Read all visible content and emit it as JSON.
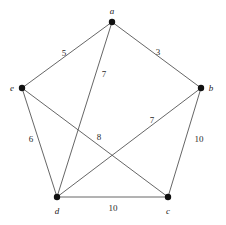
{
  "figure": {
    "type": "weighted-graph-diagram",
    "background_color": "#ffffff",
    "edge_color": "#555555",
    "node_color": "#111111",
    "label_color": "#1a1a1a"
  },
  "chart_data": {
    "type": "diagram",
    "title": "",
    "xlabel": "",
    "ylabel": "",
    "nodes": [
      {
        "id": "a",
        "label": "a",
        "x": 112,
        "y": 22,
        "label_x": 112,
        "label_y": 11
      },
      {
        "id": "b",
        "label": "b",
        "x": 201,
        "y": 88,
        "label_x": 211,
        "label_y": 88
      },
      {
        "id": "c",
        "label": "c",
        "x": 168,
        "y": 197,
        "label_x": 168,
        "label_y": 211
      },
      {
        "id": "d",
        "label": "d",
        "x": 57,
        "y": 197,
        "label_x": 57,
        "label_y": 211
      },
      {
        "id": "e",
        "label": "e",
        "x": 22,
        "y": 88,
        "label_x": 12,
        "label_y": 88
      }
    ],
    "edges": [
      {
        "from": "a",
        "to": "e",
        "weight": "5",
        "label_x": 64,
        "label_y": 53
      },
      {
        "from": "a",
        "to": "b",
        "weight": "3",
        "label_x": 158,
        "label_y": 52
      },
      {
        "from": "a",
        "to": "d",
        "weight": "7",
        "label_x": 104,
        "label_y": 74
      },
      {
        "from": "e",
        "to": "d",
        "weight": "6",
        "label_x": 31,
        "label_y": 139
      },
      {
        "from": "e",
        "to": "c",
        "weight": "8",
        "label_x": 99,
        "label_y": 137
      },
      {
        "from": "d",
        "to": "b",
        "weight": "7",
        "label_x": 152,
        "label_y": 120
      },
      {
        "from": "b",
        "to": "c",
        "weight": "10",
        "label_x": 199,
        "label_y": 139
      },
      {
        "from": "d",
        "to": "c",
        "weight": "10",
        "label_x": 113,
        "label_y": 208
      }
    ]
  }
}
